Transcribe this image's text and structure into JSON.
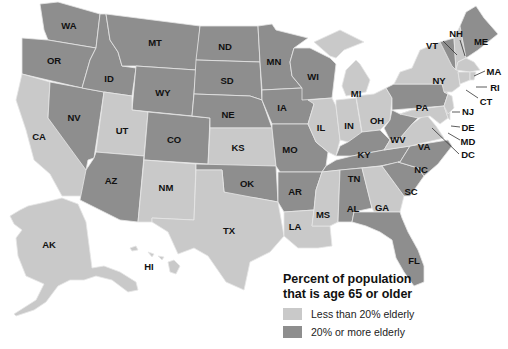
{
  "map": {
    "title": "Percent of population that is age 65 or older",
    "colors": {
      "low": "#c9c9c9",
      "high": "#8e8e8e"
    },
    "legend": {
      "title_line1": "Percent of population",
      "title_line2": "that is age 65 or older",
      "items": [
        {
          "label": "Less than 20% elderly",
          "color": "#c9c9c9"
        },
        {
          "label": "20% or more elderly",
          "color": "#8e8e8e"
        }
      ]
    },
    "states": {
      "WA": "high",
      "OR": "high",
      "CA": "low",
      "NV": "high",
      "ID": "high",
      "MT": "high",
      "WY": "high",
      "UT": "low",
      "AZ": "high",
      "CO": "high",
      "NM": "low",
      "ND": "high",
      "SD": "high",
      "NE": "high",
      "KS": "low",
      "OK": "high",
      "TX": "low",
      "MN": "high",
      "IA": "high",
      "MO": "high",
      "AR": "high",
      "LA": "low",
      "WI": "high",
      "IL": "low",
      "MI": "low",
      "IN": "low",
      "OH": "low",
      "KY": "high",
      "TN": "high",
      "MS": "low",
      "AL": "high",
      "GA": "low",
      "FL": "high",
      "SC": "high",
      "NC": "high",
      "VA": "low",
      "WV": "high",
      "PA": "high",
      "NY": "low",
      "VT": "high",
      "NH": "low",
      "ME": "high",
      "MA": "low",
      "RI": "low",
      "CT": "low",
      "NJ": "low",
      "DE": "low",
      "MD": "low",
      "DC": "low",
      "AK": "low",
      "HI": "low"
    },
    "labels": [
      "WA",
      "OR",
      "CA",
      "NV",
      "ID",
      "MT",
      "WY",
      "UT",
      "AZ",
      "CO",
      "NM",
      "ND",
      "SD",
      "NE",
      "KS",
      "OK",
      "TX",
      "MN",
      "IA",
      "MO",
      "AR",
      "LA",
      "WI",
      "IL",
      "MI",
      "IN",
      "OH",
      "KY",
      "TN",
      "MS",
      "AL",
      "GA",
      "FL",
      "SC",
      "NC",
      "VA",
      "WV",
      "PA",
      "NY",
      "VT",
      "NH",
      "ME",
      "MA",
      "RI",
      "CT",
      "NJ",
      "DE",
      "MD",
      "DC",
      "AK",
      "HI"
    ]
  }
}
